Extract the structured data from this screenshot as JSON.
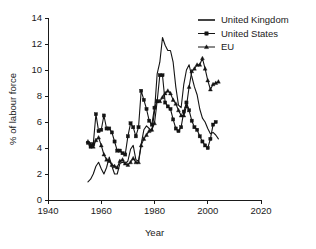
{
  "chart_data": {
    "type": "line",
    "title": "",
    "xlabel": "Year",
    "ylabel": "% of labour force",
    "xlim": [
      1940,
      2020
    ],
    "ylim": [
      0,
      14
    ],
    "xticks": [
      1940,
      1960,
      1980,
      2000,
      2020
    ],
    "yticks": [
      0,
      2,
      4,
      6,
      8,
      10,
      12,
      14
    ],
    "grid": false,
    "legend_position": "top-right",
    "series": [
      {
        "name": "United Kingdom",
        "marker": "none",
        "line": "solid",
        "x": [
          1955,
          1956,
          1957,
          1958,
          1959,
          1960,
          1961,
          1962,
          1963,
          1964,
          1965,
          1966,
          1967,
          1968,
          1969,
          1970,
          1971,
          1972,
          1973,
          1974,
          1975,
          1976,
          1977,
          1978,
          1979,
          1980,
          1981,
          1982,
          1983,
          1984,
          1985,
          1986,
          1987,
          1988,
          1989,
          1990,
          1991,
          1992,
          1993,
          1994,
          1995,
          1996,
          1997,
          1998,
          1999,
          2000,
          2001,
          2002,
          2003,
          2004
        ],
        "y": [
          1.4,
          1.6,
          2.0,
          2.6,
          2.9,
          2.4,
          2.0,
          2.5,
          3.3,
          2.6,
          2.0,
          2.0,
          2.8,
          2.9,
          2.8,
          3.0,
          3.9,
          4.2,
          3.1,
          3.0,
          4.3,
          5.4,
          5.7,
          5.5,
          5.3,
          6.8,
          9.7,
          10.6,
          12.5,
          11.9,
          11.5,
          11.5,
          10.6,
          8.7,
          7.3,
          7.1,
          8.9,
          10.0,
          10.4,
          9.5,
          8.7,
          8.1,
          7.0,
          6.3,
          6.0,
          5.5,
          5.1,
          5.2,
          5.0,
          4.7
        ]
      },
      {
        "name": "United States",
        "marker": "square",
        "line": "solid",
        "x": [
          1955,
          1956,
          1957,
          1958,
          1959,
          1960,
          1961,
          1962,
          1963,
          1964,
          1965,
          1966,
          1967,
          1968,
          1969,
          1970,
          1971,
          1972,
          1973,
          1974,
          1975,
          1976,
          1977,
          1978,
          1979,
          1980,
          1981,
          1982,
          1983,
          1984,
          1985,
          1986,
          1987,
          1988,
          1989,
          1990,
          1991,
          1992,
          1993,
          1994,
          1995,
          1996,
          1997,
          1998,
          1999,
          2000,
          2001,
          2002,
          2003
        ],
        "y": [
          4.4,
          4.1,
          4.3,
          6.6,
          5.3,
          5.4,
          6.5,
          5.5,
          5.5,
          5.2,
          4.5,
          3.8,
          3.8,
          3.6,
          3.5,
          4.9,
          5.9,
          5.6,
          4.9,
          5.6,
          8.4,
          7.7,
          7.0,
          6.1,
          5.8,
          7.1,
          7.6,
          9.6,
          9.6,
          7.5,
          7.2,
          7.0,
          6.2,
          5.5,
          5.3,
          5.6,
          6.8,
          7.5,
          6.9,
          6.1,
          5.6,
          5.4,
          4.9,
          4.5,
          4.2,
          4.0,
          4.7,
          5.8,
          6.0
        ]
      },
      {
        "name": "EU",
        "marker": "triangle",
        "line": "solid",
        "x": [
          1955,
          1956,
          1957,
          1958,
          1959,
          1960,
          1961,
          1962,
          1963,
          1964,
          1965,
          1966,
          1967,
          1968,
          1969,
          1970,
          1971,
          1972,
          1973,
          1974,
          1975,
          1976,
          1977,
          1978,
          1979,
          1980,
          1981,
          1982,
          1983,
          1984,
          1985,
          1986,
          1987,
          1988,
          1989,
          1990,
          1991,
          1992,
          1993,
          1994,
          1995,
          1996,
          1997,
          1998,
          1999,
          2000,
          2001,
          2002,
          2003,
          2004
        ],
        "y": [
          4.5,
          4.3,
          4.1,
          4.6,
          4.8,
          4.2,
          3.5,
          3.1,
          3.0,
          2.7,
          2.6,
          2.5,
          3.0,
          3.1,
          2.8,
          2.7,
          2.9,
          3.2,
          2.9,
          2.9,
          4.2,
          4.7,
          5.0,
          5.3,
          5.4,
          5.9,
          7.6,
          7.6,
          7.9,
          8.2,
          8.4,
          8.2,
          7.7,
          7.4,
          6.9,
          6.5,
          6.5,
          7.2,
          8.7,
          9.9,
          10.1,
          10.4,
          10.4,
          10.9,
          10.1,
          9.2,
          8.5,
          8.9,
          9.0,
          9.1
        ]
      }
    ]
  },
  "axes": {
    "y_title": "% of labour force",
    "x_title": "Year",
    "y_tick_labels": [
      "0",
      "2",
      "4",
      "6",
      "8",
      "10",
      "12",
      "14"
    ],
    "x_tick_labels": [
      "1940",
      "1960",
      "1980",
      "2000",
      "2020"
    ]
  },
  "legend": {
    "entries": [
      {
        "label": "United Kingdom",
        "marker": "line-only"
      },
      {
        "label": "United States",
        "marker": "square-marker"
      },
      {
        "label": "EU",
        "marker": "triangle-marker"
      }
    ]
  },
  "colors": {
    "ink": "#141414",
    "background": "#ffffff"
  }
}
